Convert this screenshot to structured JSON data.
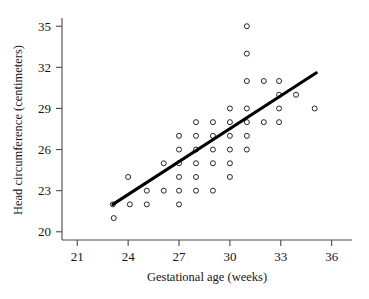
{
  "chart_data": {
    "type": "scatter",
    "title": "",
    "xlabel": "Gestational age (weeks)",
    "ylabel": "Head circumference (centimeters)",
    "xlim": [
      20.1,
      37.2
    ],
    "ylim": [
      19.4,
      35.6
    ],
    "xticks": [
      21,
      24,
      27,
      30,
      33,
      36
    ],
    "xtick_labels": [
      "21",
      "24",
      "27",
      "30",
      "33",
      "36"
    ],
    "yticks": [
      20,
      23,
      26,
      29,
      32,
      35
    ],
    "ytick_labels": [
      "20",
      "23",
      "26",
      "29",
      "32",
      "35"
    ],
    "grid": false,
    "legend": null,
    "marker": "open-circle",
    "points": [
      {
        "x": 23.1,
        "y": 22.0
      },
      {
        "x": 23.15,
        "y": 21.0
      },
      {
        "x": 24.0,
        "y": 24.0
      },
      {
        "x": 24.1,
        "y": 22.0
      },
      {
        "x": 25.1,
        "y": 22.0
      },
      {
        "x": 25.1,
        "y": 23.0
      },
      {
        "x": 26.1,
        "y": 23.0
      },
      {
        "x": 26.1,
        "y": 25.0
      },
      {
        "x": 27.0,
        "y": 22.0
      },
      {
        "x": 27.0,
        "y": 23.0
      },
      {
        "x": 27.0,
        "y": 24.0
      },
      {
        "x": 27.0,
        "y": 25.0
      },
      {
        "x": 27.0,
        "y": 26.0
      },
      {
        "x": 27.0,
        "y": 27.0
      },
      {
        "x": 28.0,
        "y": 23.0
      },
      {
        "x": 28.0,
        "y": 24.0
      },
      {
        "x": 28.0,
        "y": 25.0
      },
      {
        "x": 28.0,
        "y": 26.0
      },
      {
        "x": 28.0,
        "y": 27.0
      },
      {
        "x": 28.0,
        "y": 28.0
      },
      {
        "x": 29.0,
        "y": 23.0
      },
      {
        "x": 29.0,
        "y": 25.0
      },
      {
        "x": 29.0,
        "y": 26.0
      },
      {
        "x": 29.0,
        "y": 27.0
      },
      {
        "x": 29.0,
        "y": 28.0
      },
      {
        "x": 30.0,
        "y": 24.0
      },
      {
        "x": 30.0,
        "y": 25.0
      },
      {
        "x": 30.0,
        "y": 26.0
      },
      {
        "x": 30.0,
        "y": 27.0
      },
      {
        "x": 30.0,
        "y": 28.0
      },
      {
        "x": 30.0,
        "y": 29.0
      },
      {
        "x": 31.0,
        "y": 26.0
      },
      {
        "x": 31.0,
        "y": 27.0
      },
      {
        "x": 31.0,
        "y": 28.0
      },
      {
        "x": 31.0,
        "y": 29.0
      },
      {
        "x": 31.0,
        "y": 31.0
      },
      {
        "x": 31.0,
        "y": 33.0
      },
      {
        "x": 31.0,
        "y": 35.0
      },
      {
        "x": 32.0,
        "y": 28.0
      },
      {
        "x": 32.0,
        "y": 31.0
      },
      {
        "x": 32.9,
        "y": 28.0
      },
      {
        "x": 32.9,
        "y": 29.0
      },
      {
        "x": 32.9,
        "y": 30.0
      },
      {
        "x": 32.9,
        "y": 31.0
      },
      {
        "x": 33.9,
        "y": 30.0
      },
      {
        "x": 35.0,
        "y": 29.0
      }
    ],
    "trend_line": {
      "x_start": 23.1,
      "y_start": 22.0,
      "x_end": 35.1,
      "y_end": 31.6
    }
  },
  "axes": {
    "x_axis_name": "gestational-age-axis",
    "y_axis_name": "head-circumference-axis"
  }
}
